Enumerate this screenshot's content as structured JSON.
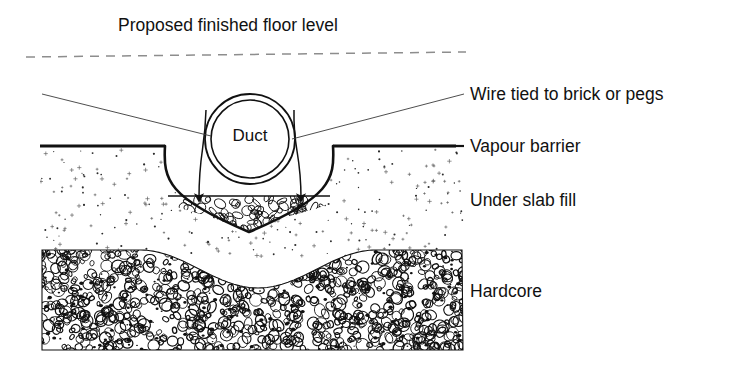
{
  "figure": {
    "kind": "construction-cross-section",
    "title": "Proposed finished floor level",
    "background_color": "#ffffff",
    "ink_color": "#111111"
  },
  "title_note": {
    "text": "Proposed finished floor level",
    "x": 118,
    "y": 26
  },
  "floor_level_line": {
    "name": "proposed-finished-floor-level",
    "style": "dashed",
    "x1": 26,
    "y1": 57,
    "x2": 466,
    "y2": 52,
    "color": "#8d8d8d"
  },
  "duct": {
    "label": "Duct",
    "center_x": 250,
    "center_y": 139,
    "outer_radius": 45,
    "inner_radius": 39,
    "label_x": 250,
    "label_y": 137
  },
  "labels": [
    {
      "id": "wire-tied-to-brick-or-pegs",
      "text": "Wire tied to brick or pegs",
      "x": 470,
      "y": 95
    },
    {
      "id": "vapour-barrier",
      "text": "Vapour barrier",
      "x": 470,
      "y": 147
    },
    {
      "id": "under-slab-fill",
      "text": "Under slab fill",
      "x": 470,
      "y": 201
    },
    {
      "id": "hardcore",
      "text": "Hardcore",
      "x": 470,
      "y": 292
    }
  ],
  "leader_lines": [
    {
      "id": "wire-leader-left",
      "from_x": 42,
      "from_y": 94,
      "to_x": 211,
      "to_y": 136
    },
    {
      "id": "wire-leader-right",
      "from_x": 464,
      "from_y": 94,
      "to_x": 292,
      "to_y": 139
    },
    {
      "id": "vapour-barrier-leader",
      "from_x": 440,
      "from_y": 146,
      "to_x": 464,
      "to_y": 146
    }
  ],
  "vapour_barrier": {
    "name": "vapour-barrier-membrane",
    "stroke_width": 3.2,
    "left_run": {
      "x1": 40,
      "y1": 146,
      "x2": 165,
      "y2": 146
    },
    "right_run": {
      "x1": 333,
      "y1": 146,
      "x2": 456,
      "y2": 146
    }
  },
  "trench": {
    "name": "duct-trench",
    "left_lip_x": 165,
    "right_lip_x": 333,
    "lip_y": 146,
    "bottom_y": 232,
    "fill_top_y": 196
  },
  "granular_fill": {
    "name": "granular-bedding",
    "description": "rounded aggregate bedding in base of trench",
    "pebble_count": 34
  },
  "wires": [
    {
      "id": "wire-peg-left",
      "top_x": 206,
      "top_y": 110,
      "bottom_x": 199,
      "bottom_y": 198
    },
    {
      "id": "wire-peg-right",
      "top_x": 294,
      "top_y": 110,
      "bottom_x": 301,
      "bottom_y": 198
    }
  ],
  "under_slab_fill": {
    "name": "under-slab-fill-stipple",
    "top_y": 146,
    "bottom_y": 258,
    "left_x": 40,
    "right_x": 464,
    "dot_count": 150
  },
  "hardcore": {
    "name": "hardcore-layer",
    "left_x": 42,
    "right_x": 463,
    "top_y": 250,
    "bottom_y": 350,
    "trough_center_x": 258,
    "trough_depth": 38,
    "stone_count": 900
  }
}
